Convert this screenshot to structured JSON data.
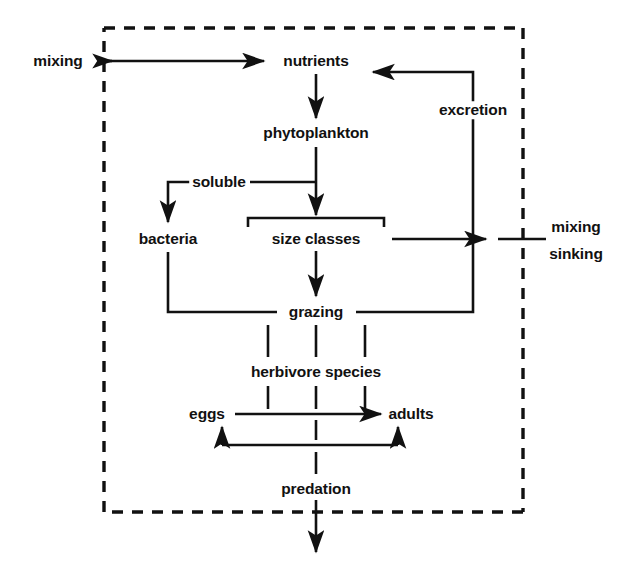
{
  "diagram": {
    "system_boundary_label": "model system boundary (dashed box)",
    "colors": {
      "line": "#111111",
      "text": "#111111",
      "background": "#ffffff"
    },
    "nodes": [
      {
        "id": "mixing-in",
        "label": "mixing",
        "x": 58,
        "y": 61,
        "anchor": "center"
      },
      {
        "id": "nutrients",
        "label": "nutrients",
        "x": 316,
        "y": 61,
        "anchor": "center"
      },
      {
        "id": "excretion",
        "label": "excretion",
        "x": 473,
        "y": 110,
        "anchor": "center"
      },
      {
        "id": "phytoplankton",
        "label": "phytoplankton",
        "x": 316,
        "y": 133,
        "anchor": "center"
      },
      {
        "id": "soluble",
        "label": "soluble",
        "x": 219,
        "y": 182,
        "anchor": "center"
      },
      {
        "id": "bacteria",
        "label": "bacteria",
        "x": 168,
        "y": 239,
        "anchor": "center"
      },
      {
        "id": "size-classes",
        "label": "size classes",
        "x": 316,
        "y": 239,
        "anchor": "center"
      },
      {
        "id": "mixing-out",
        "label": "mixing",
        "x": 576,
        "y": 227,
        "anchor": "center"
      },
      {
        "id": "sinking-out",
        "label": "sinking",
        "x": 576,
        "y": 254,
        "anchor": "center"
      },
      {
        "id": "grazing",
        "label": "grazing",
        "x": 316,
        "y": 312,
        "anchor": "center"
      },
      {
        "id": "herbivore-species",
        "label": "herbivore species",
        "x": 316,
        "y": 372,
        "anchor": "center"
      },
      {
        "id": "eggs",
        "label": "eggs",
        "x": 207,
        "y": 414,
        "anchor": "center"
      },
      {
        "id": "adults",
        "label": "adults",
        "x": 411,
        "y": 414,
        "anchor": "center"
      },
      {
        "id": "predation",
        "label": "predation",
        "x": 316,
        "y": 489,
        "anchor": "center"
      }
    ],
    "edges": [
      {
        "id": "mixing-to-nutrients",
        "from": "mixing-in",
        "to": "nutrients",
        "kind": "arrow-right"
      },
      {
        "id": "nutrients-to-phytoplankton",
        "from": "nutrients",
        "to": "phytoplankton",
        "kind": "arrow-down"
      },
      {
        "id": "phytoplankton-to-soluble",
        "from": "phytoplankton",
        "to": "soluble",
        "kind": "line-left"
      },
      {
        "id": "phytoplankton-to-size",
        "from": "phytoplankton",
        "to": "size-classes",
        "kind": "arrow-down"
      },
      {
        "id": "soluble-to-bacteria",
        "from": "soluble",
        "to": "bacteria",
        "kind": "elbow-arrow-down"
      },
      {
        "id": "size-to-grazing",
        "from": "size-classes",
        "to": "grazing",
        "kind": "arrow-down"
      },
      {
        "id": "size-to-mixing-sinking",
        "from": "size-classes",
        "to": "mixing-out",
        "kind": "arrow-right-export"
      },
      {
        "id": "bacteria-to-grazing",
        "from": "bacteria",
        "to": "grazing",
        "kind": "elbow-line"
      },
      {
        "id": "grazing-to-excretion",
        "from": "grazing",
        "to": "excretion",
        "kind": "elbow-up"
      },
      {
        "id": "excretion-to-nutrients",
        "from": "excretion",
        "to": "nutrients",
        "kind": "elbow-arrow-left"
      },
      {
        "id": "grazing-to-herbivores",
        "from": "grazing",
        "to": "herbivore-species",
        "kind": "triple-line"
      },
      {
        "id": "herbivores-to-stages",
        "from": "herbivore-species",
        "to": "eggs",
        "kind": "triple-line"
      },
      {
        "id": "eggs-to-adults",
        "from": "eggs",
        "to": "adults",
        "kind": "arrow-right"
      },
      {
        "id": "adults-to-eggs",
        "from": "adults",
        "to": "eggs",
        "kind": "u-loop-arrows"
      },
      {
        "id": "stages-to-predation",
        "from": "herbivore-species",
        "to": "predation",
        "kind": "dashed-down"
      },
      {
        "id": "predation-export",
        "from": "predation",
        "to": "",
        "kind": "arrow-down-export"
      }
    ],
    "boundary": {
      "x1": 104,
      "y1": 28,
      "x2": 523,
      "y2": 512
    }
  }
}
